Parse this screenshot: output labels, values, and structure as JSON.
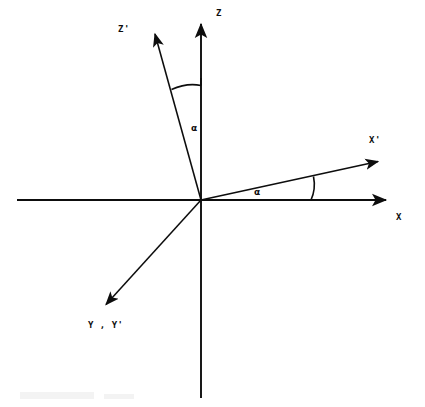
{
  "figure": {
    "type": "diagram",
    "background_color": "#ffffff",
    "stroke_color": "#0d0d0d",
    "width": 425,
    "height": 407
  },
  "origin": {
    "x": 201,
    "y": 200
  },
  "axes": [
    {
      "id": "z",
      "label": "Z",
      "label_x": 216,
      "label_y": 9,
      "from": {
        "x": 201,
        "y": 398
      },
      "to": {
        "x": 201,
        "y": 22
      },
      "arrow": true,
      "stroke_width": 1.9
    },
    {
      "id": "z-prime",
      "label": "Z'",
      "label_x": 118,
      "label_y": 24,
      "from": {
        "x": 201,
        "y": 200
      },
      "to": {
        "x": 153,
        "y": 28
      },
      "arrow": true,
      "stroke_width": 1.6
    },
    {
      "id": "x",
      "label": "X",
      "label_x": 396,
      "label_y": 212,
      "from": {
        "x": 17,
        "y": 200
      },
      "to": {
        "x": 394,
        "y": 200
      },
      "arrow": true,
      "stroke_width": 1.9
    },
    {
      "id": "x-prime",
      "label": "X'",
      "label_x": 368,
      "label_y": 134,
      "from": {
        "x": 201,
        "y": 200
      },
      "to": {
        "x": 385,
        "y": 160
      },
      "arrow": true,
      "stroke_width": 1.6
    },
    {
      "id": "y-y-prime",
      "label": "Y , Y'",
      "label_x": 88,
      "label_y": 320,
      "from": {
        "x": 201,
        "y": 200
      },
      "to": {
        "x": 101,
        "y": 310
      },
      "arrow": true,
      "stroke_width": 1.6
    }
  ],
  "angles": [
    {
      "id": "angle-z",
      "symbol": "α",
      "label_x": 190,
      "label_y": 123,
      "arc_between": [
        "z-prime",
        "z"
      ],
      "arc_radius": 114,
      "tick_from": {
        "x": 172,
        "y": 89
      },
      "tick_to": {
        "x": 201,
        "y": 86
      }
    },
    {
      "id": "angle-x",
      "symbol": "α",
      "label_x": 254,
      "label_y": 187,
      "arc_between": [
        "x",
        "x-prime"
      ],
      "arc_radius": 112,
      "tick_from": {
        "x": 311,
        "y": 200
      },
      "tick_to": {
        "x": 313,
        "y": 176
      }
    }
  ]
}
